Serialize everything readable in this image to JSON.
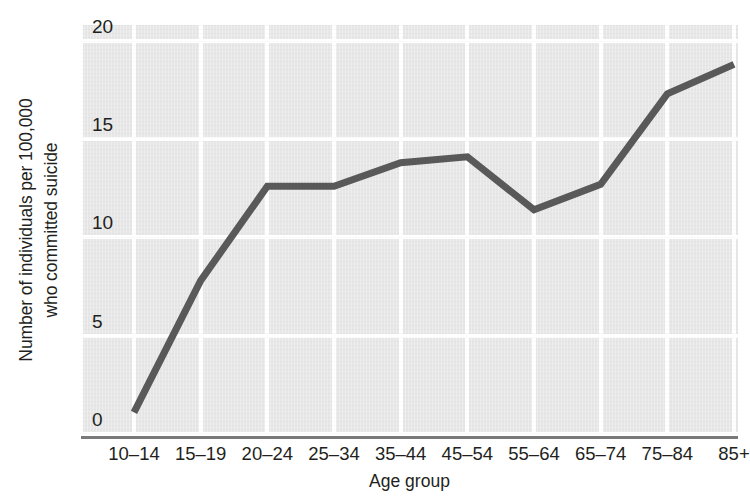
{
  "chart_data": {
    "type": "line",
    "title": "",
    "xlabel": "Age group",
    "ylabel_line1": "Number of individuals per 100,000",
    "ylabel_line2": "who committed suicide",
    "categories": [
      "10–14",
      "15–19",
      "20–24",
      "25–34",
      "35–44",
      "45–54",
      "55–64",
      "65–74",
      "75–84",
      "85+"
    ],
    "values": [
      1.1,
      7.8,
      12.6,
      12.6,
      13.8,
      14.1,
      11.4,
      12.7,
      17.3,
      18.8
    ],
    "ylim": [
      0,
      20.8
    ],
    "yticks": [
      0,
      5,
      10,
      15,
      20
    ],
    "ytick_labels": [
      "0",
      "5",
      "10",
      "15",
      "20"
    ],
    "grid": true,
    "legend": "none",
    "series_name": "Suicide rate",
    "line_color": "#595959",
    "plot_background": "#e6e7e6",
    "gridline_color": "#ffffff",
    "axis_color": "#7a7a7a",
    "text_color": "#231f20"
  }
}
